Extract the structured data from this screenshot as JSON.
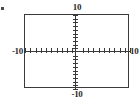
{
  "graph": {
    "title": "",
    "description": "graphing calculator viewing window",
    "frame_color": "#3a3a3a",
    "axis_color": "#3a3a3a",
    "background": "#ffffff",
    "labels": {
      "top": "10",
      "bottom": "-10",
      "left": "-10",
      "right": "10"
    }
  },
  "chart_data": {
    "type": "line",
    "title": "",
    "xlabel": "",
    "ylabel": "",
    "xlim": [
      -10,
      10
    ],
    "ylim": [
      -10,
      10
    ],
    "xtick_interval": 1,
    "ytick_interval": 1,
    "xticks": [
      -10,
      -9,
      -8,
      -7,
      -6,
      -5,
      -4,
      -3,
      -2,
      -1,
      0,
      1,
      2,
      3,
      4,
      5,
      6,
      7,
      8,
      9,
      10
    ],
    "yticks": [
      -10,
      -9,
      -8,
      -7,
      -6,
      -5,
      -4,
      -3,
      -2,
      -1,
      0,
      1,
      2,
      3,
      4,
      5,
      6,
      7,
      8,
      9,
      10
    ],
    "visible_tick_labels": {
      "xmin": "-10",
      "xmax": "10",
      "ymin": "-10",
      "ymax": "10"
    },
    "grid": false,
    "legend": null,
    "series": [],
    "annotations": []
  }
}
